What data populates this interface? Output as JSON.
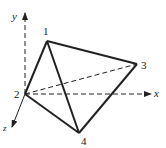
{
  "diagram": {
    "axes": {
      "x": "x",
      "y": "y",
      "z": "z"
    },
    "nodes": [
      {
        "id": "1",
        "label": "1"
      },
      {
        "id": "2",
        "label": "2"
      },
      {
        "id": "3",
        "label": "3"
      },
      {
        "id": "4",
        "label": "4"
      }
    ],
    "solid_edges": [
      [
        "1",
        "2"
      ],
      [
        "1",
        "3"
      ],
      [
        "1",
        "4"
      ],
      [
        "2",
        "4"
      ],
      [
        "3",
        "4"
      ]
    ],
    "dashed_edges": [
      [
        "2",
        "3"
      ]
    ],
    "colors": {
      "stroke": "#222222",
      "background": "#ffffff"
    }
  }
}
